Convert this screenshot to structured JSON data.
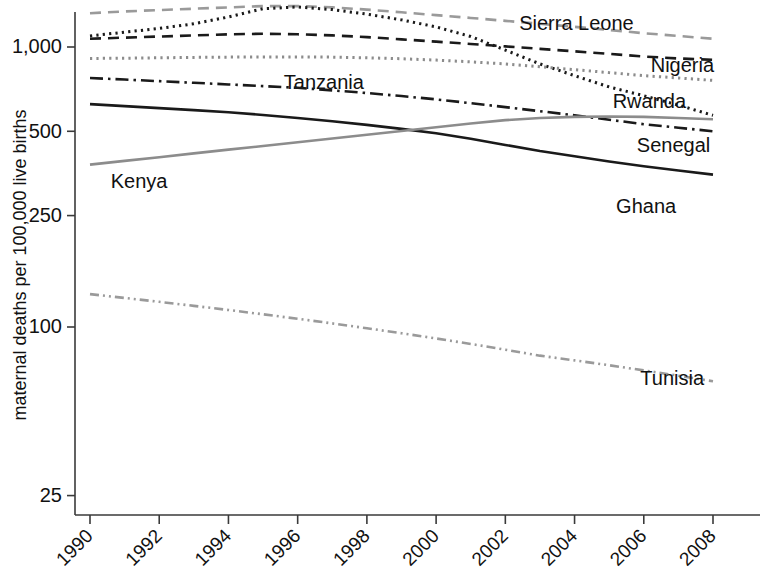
{
  "chart_data": {
    "type": "line",
    "title": "",
    "subtitle": "",
    "xlabel": "",
    "ylabel": "maternal deaths per 100,000 live births",
    "x": [
      1990,
      1991,
      1992,
      1993,
      1994,
      1995,
      1996,
      1997,
      1998,
      1999,
      2000,
      2001,
      2002,
      2003,
      2004,
      2005,
      2006,
      2007,
      2008
    ],
    "x_tick_labels": [
      "1990",
      "1992",
      "1994",
      "1996",
      "1998",
      "2000",
      "2002",
      "2004",
      "2006",
      "2008"
    ],
    "x_ticks": [
      1990,
      1992,
      1994,
      1996,
      1998,
      2000,
      2002,
      2004,
      2006,
      2008
    ],
    "xlim": [
      1990,
      2008
    ],
    "y_scale": "log",
    "y_ticks": [
      25,
      100,
      250,
      500,
      1000
    ],
    "y_tick_labels": [
      "25",
      "100",
      "250",
      "500",
      "1,000"
    ],
    "ylim": [
      25,
      1450
    ],
    "grid": false,
    "legend_position": "inline-annotations",
    "series": [
      {
        "name": "Sierra Leone",
        "color": "#9a9a9a",
        "dash": "dashed",
        "label_x": 2002.4,
        "label_y_px": 30,
        "values": [
          1320,
          1340,
          1355,
          1370,
          1385,
          1400,
          1400,
          1385,
          1360,
          1330,
          1300,
          1270,
          1240,
          1210,
          1180,
          1150,
          1120,
          1095,
          1070
        ]
      },
      {
        "name": "Rwanda",
        "color": "#1a1a1a",
        "dash": "dotted",
        "label_x": 2005.1,
        "label_y_px": 108,
        "values": [
          1095,
          1130,
          1165,
          1210,
          1280,
          1370,
          1390,
          1360,
          1310,
          1250,
          1180,
          1090,
          975,
          870,
          790,
          720,
          670,
          620,
          570
        ]
      },
      {
        "name": "Nigeria",
        "color": "#1a1a1a",
        "dash": "dashed",
        "label_x": 2006.2,
        "label_y_px": 72,
        "values": [
          1070,
          1080,
          1090,
          1100,
          1110,
          1115,
          1110,
          1100,
          1085,
          1065,
          1045,
          1025,
          1005,
          985,
          965,
          945,
          925,
          910,
          900
        ]
      },
      {
        "name": "Tanzania",
        "color": "#8c8c8c",
        "dash": "dotted",
        "label_x": 1995.6,
        "label_y_px": 89,
        "values": [
          910,
          912,
          915,
          918,
          920,
          922,
          922,
          920,
          915,
          908,
          898,
          885,
          870,
          850,
          830,
          810,
          790,
          775,
          760
        ]
      },
      {
        "name": "Senegal",
        "color": "#1a1a1a",
        "dash": "dashdot",
        "label_x": 2005.8,
        "label_y_px": 152,
        "values": [
          775,
          765,
          755,
          745,
          735,
          725,
          715,
          700,
          685,
          668,
          650,
          630,
          610,
          590,
          570,
          550,
          530,
          515,
          500
        ]
      },
      {
        "name": "Ghana",
        "color": "#1a1a1a",
        "dash": "solid",
        "label_x": 2005.2,
        "label_y_px": 213,
        "values": [
          625,
          615,
          605,
          595,
          585,
          572,
          558,
          543,
          527,
          510,
          492,
          470,
          447,
          425,
          407,
          390,
          375,
          362,
          350
        ]
      },
      {
        "name": "Kenya",
        "color": "#8c8c8c",
        "dash": "solid",
        "label_x": 1990.6,
        "label_y_px": 188,
        "values": [
          380,
          392,
          404,
          417,
          430,
          443,
          457,
          471,
          486,
          501,
          517,
          533,
          548,
          558,
          563,
          565,
          563,
          558,
          552
        ]
      },
      {
        "name": "Tunisia",
        "color": "#9a9a9a",
        "dash": "dashdotdot",
        "label_x": 2005.9,
        "label_y_px": 385,
        "values": [
          131,
          127,
          123,
          119,
          115,
          111,
          107,
          103,
          99,
          95,
          91,
          87,
          83,
          79,
          76,
          73,
          70,
          67,
          64
        ]
      }
    ]
  }
}
